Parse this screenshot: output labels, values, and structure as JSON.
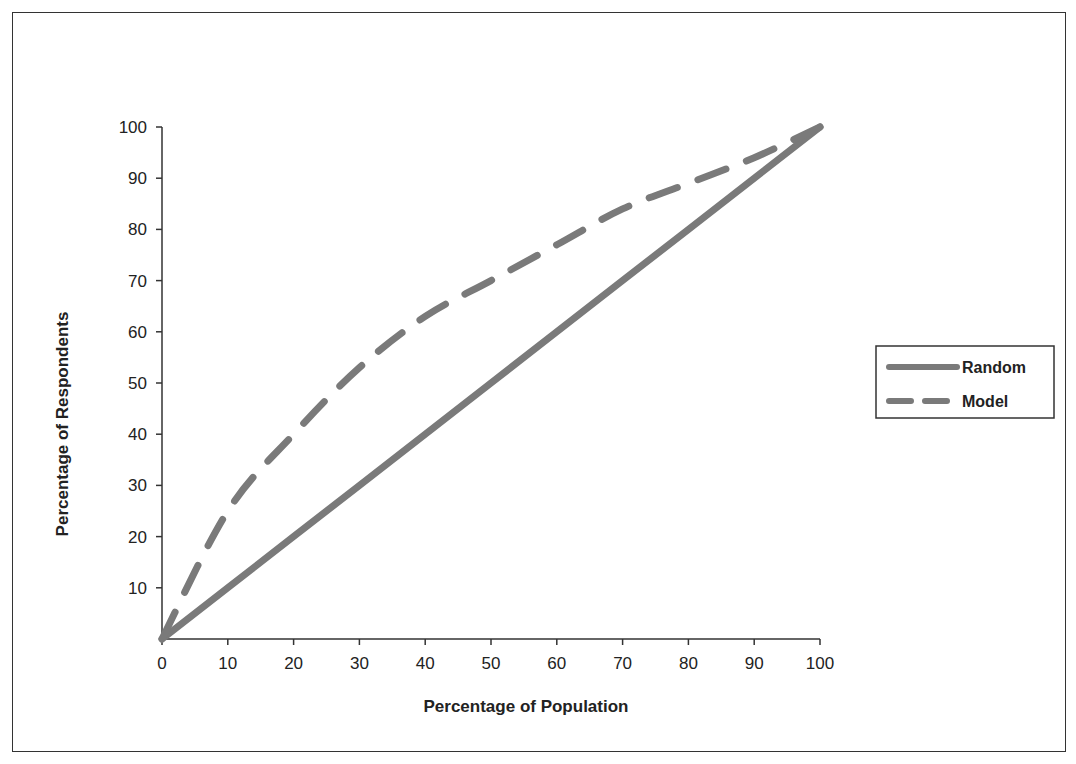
{
  "chart_data": {
    "type": "line",
    "title": "",
    "xlabel": "Percentage of Population",
    "ylabel": "Percentage of Respondents",
    "xlim": [
      0,
      100
    ],
    "ylim": [
      0,
      100
    ],
    "x_ticks": [
      "0",
      "10",
      "20",
      "30",
      "40",
      "50",
      "60",
      "70",
      "80",
      "90",
      "100"
    ],
    "y_ticks": [
      "10",
      "20",
      "30",
      "40",
      "50",
      "60",
      "70",
      "80",
      "90",
      "100"
    ],
    "grid": false,
    "legend_position": "right",
    "x": [
      0,
      10,
      20,
      30,
      40,
      50,
      60,
      70,
      80,
      90,
      100
    ],
    "series": [
      {
        "name": "Random",
        "style": "solid",
        "color": "#7a7a7a",
        "values": [
          0,
          10,
          20,
          30,
          40,
          50,
          60,
          70,
          80,
          90,
          100
        ]
      },
      {
        "name": "Model",
        "style": "dashed",
        "color": "#7a7a7a",
        "values": [
          0,
          25,
          40,
          53,
          63,
          70,
          77,
          84,
          89,
          94,
          100
        ]
      }
    ]
  },
  "legend": {
    "items": [
      "Random",
      "Model"
    ]
  }
}
